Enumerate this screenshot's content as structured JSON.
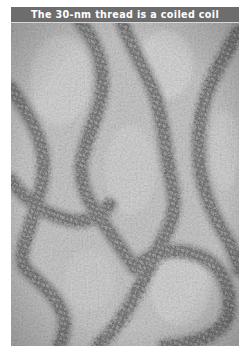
{
  "figure": {
    "title": "The 30-nm thread is a coiled coil",
    "image_description": "Grayscale electron micrograph of beaded chromatin fibers (30-nm threads) coiling across a grainy background",
    "colors": {
      "title_bar": "#6d6d6d",
      "title_text": "#ffffff",
      "background_gray": "#bdbdbd",
      "fiber_dark": "#3a3a3a"
    }
  }
}
